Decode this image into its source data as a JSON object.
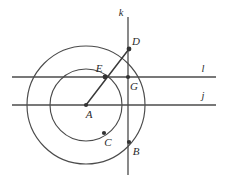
{
  "figure": {
    "background_color": "#ffffff",
    "stroke_color": "#4b4b4b",
    "label_color": "#2b2b2b",
    "width": 228,
    "height": 184
  },
  "circles": [
    {
      "name": "outer-circle",
      "center_label": "A",
      "cx": 86,
      "cy": 105,
      "r": 59
    },
    {
      "name": "inner-circle",
      "center_label": "A",
      "cx": 86,
      "cy": 105,
      "r": 36
    }
  ],
  "lines": [
    {
      "name": "line-k",
      "label": "k",
      "orientation": "vertical",
      "x1": 128,
      "y1": 17,
      "x2": 128,
      "y2": 175,
      "label_x": 121,
      "label_y": 15
    },
    {
      "name": "line-l",
      "label": "l",
      "orientation": "horizontal",
      "x1": 12,
      "y1": 77,
      "x2": 216,
      "y2": 77,
      "label_x": 202,
      "label_y": 71
    },
    {
      "name": "line-j",
      "label": "j",
      "orientation": "horizontal",
      "x1": 12,
      "y1": 105,
      "x2": 216,
      "y2": 105,
      "label_x": 202,
      "label_y": 99
    }
  ],
  "segments": [
    {
      "name": "segment-a-to-d",
      "from": "A",
      "to": "D",
      "x1": 86,
      "y1": 105,
      "x2": 129,
      "y2": 49
    }
  ],
  "points": [
    {
      "name": "point-a",
      "label": "A",
      "x": 86,
      "y": 105,
      "label_x": 89,
      "label_y": 118,
      "dot": true
    },
    {
      "name": "point-b",
      "label": "B",
      "x": 129,
      "y": 142,
      "label_x": 136,
      "label_y": 155,
      "dot": true
    },
    {
      "name": "point-c",
      "label": "C",
      "x": 104,
      "y": 133,
      "label_x": 108,
      "label_y": 146,
      "dot": true
    },
    {
      "name": "point-d",
      "label": "D",
      "x": 129,
      "y": 49,
      "label_x": 134,
      "label_y": 45,
      "dot": true
    },
    {
      "name": "point-e",
      "label": "E",
      "x": 105,
      "y": 77,
      "label_x": 96,
      "label_y": 71,
      "dot": true
    },
    {
      "name": "point-g",
      "label": "G",
      "x": 128,
      "y": 77,
      "label_x": 132,
      "label_y": 90,
      "dot": true
    }
  ]
}
